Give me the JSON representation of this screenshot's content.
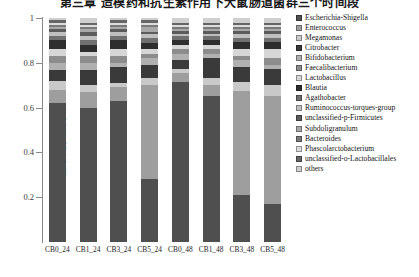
{
  "title": "第三章 造模药和抗生素作用下大鼠肠道菌群三个时间段",
  "chart_data": {
    "type": "bar",
    "subtype": "stacked-bar-100",
    "title": "第三章 造模药和抗生素作用下大鼠肠道菌群三个时间段",
    "xlabel": "",
    "ylabel": "相对丰度（属水平）",
    "ylim": [
      0,
      1
    ],
    "yticks": [
      0,
      0.2,
      0.4,
      0.6,
      0.8,
      1
    ],
    "ytick_labels": [
      "",
      "0.2",
      "0.4",
      "0.6",
      "0.8",
      "1"
    ],
    "grid": false,
    "legend_position": "right",
    "categories": [
      "CB0_24",
      "CB1_24",
      "CB3_24",
      "CB5_24",
      "CB0_48",
      "CB1_48",
      "CB3_48",
      "CB5_48"
    ],
    "series": [
      {
        "name": "Escherichia-Shigella",
        "color": "#4f4f4f",
        "values": [
          0.62,
          0.6,
          0.63,
          0.28,
          0.72,
          0.66,
          0.21,
          0.17
        ]
      },
      {
        "name": "Enterococcus",
        "color": "#9e9e9e",
        "values": [
          0.06,
          0.07,
          0.06,
          0.42,
          0.04,
          0.05,
          0.47,
          0.49
        ]
      },
      {
        "name": "Megamonas",
        "color": "#c9c9c9",
        "values": [
          0.04,
          0.03,
          0.02,
          0.03,
          0.02,
          0.03,
          0.04,
          0.05
        ]
      },
      {
        "name": "Citrobacter",
        "color": "#3a3a3a",
        "values": [
          0.05,
          0.07,
          0.07,
          0.06,
          0.04,
          0.09,
          0.07,
          0.07
        ]
      },
      {
        "name": "Bifidobacterium",
        "color": "#b0b0b0",
        "values": [
          0.03,
          0.03,
          0.02,
          0.03,
          0.03,
          0.02,
          0.03,
          0.02
        ]
      },
      {
        "name": "Faecalibacterium",
        "color": "#8c8c8c",
        "values": [
          0.03,
          0.03,
          0.03,
          0.02,
          0.02,
          0.02,
          0.02,
          0.03
        ]
      },
      {
        "name": "Lactobacillus",
        "color": "#d6d6d6",
        "values": [
          0.03,
          0.02,
          0.03,
          0.02,
          0.02,
          0.02,
          0.03,
          0.04
        ]
      },
      {
        "name": "Blautia",
        "color": "#2e2e2e",
        "values": [
          0.04,
          0.03,
          0.04,
          0.03,
          0.02,
          0.02,
          0.03,
          0.03
        ]
      },
      {
        "name": "Agathobacter",
        "color": "#707070",
        "values": [
          0.02,
          0.02,
          0.02,
          0.02,
          0.02,
          0.02,
          0.02,
          0.02
        ]
      },
      {
        "name": "Ruminococcus-torques-group",
        "color": "#bfbfbf",
        "values": [
          0.02,
          0.02,
          0.02,
          0.02,
          0.01,
          0.01,
          0.02,
          0.02
        ]
      },
      {
        "name": "unclassified-p-Firmicutes",
        "color": "#5c5c5c",
        "values": [
          0.01,
          0.02,
          0.01,
          0.01,
          0.01,
          0.01,
          0.01,
          0.01
        ]
      },
      {
        "name": "Subdoligranulum",
        "color": "#a8a8a8",
        "values": [
          0.01,
          0.01,
          0.01,
          0.02,
          0.01,
          0.01,
          0.01,
          0.01
        ]
      },
      {
        "name": "Bacteroides",
        "color": "#7a7a7a",
        "values": [
          0.01,
          0.01,
          0.01,
          0.01,
          0.01,
          0.01,
          0.01,
          0.01
        ]
      },
      {
        "name": "Phascolarctobacterium",
        "color": "#dcdcdc",
        "values": [
          0.01,
          0.01,
          0.01,
          0.01,
          0.01,
          0.01,
          0.01,
          0.01
        ]
      },
      {
        "name": "unclassified-o-Lactobacillales",
        "color": "#666666",
        "values": [
          0.01,
          0.01,
          0.01,
          0.01,
          0.01,
          0.01,
          0.01,
          0.01
        ]
      },
      {
        "name": "others",
        "color": "#cfcfcf",
        "values": [
          0.01,
          0.02,
          0.01,
          0.01,
          0.02,
          0.02,
          0.02,
          0.02
        ]
      }
    ]
  },
  "legend": {
    "items": [
      "Escherichia-Shigella",
      "Enterococcus",
      "Megamonas",
      "Citrobacter",
      "Bifidobacterium",
      "Faecalibacterium",
      "Lactobacillus",
      "Blautia",
      "Agathobacter",
      "Ruminococcus-torques-group",
      "unclassified-p-Firmicutes",
      "Subdoligranulum",
      "Bacteroides",
      "Phascolarctobacterium",
      "unclassified-o-Lactobacillales",
      "others"
    ]
  }
}
